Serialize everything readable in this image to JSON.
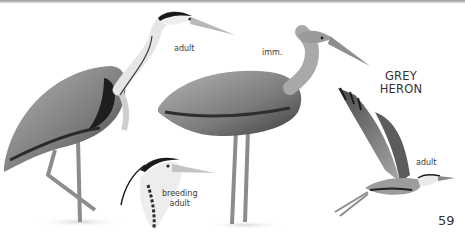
{
  "page": {
    "species_title_line1": "GREY",
    "species_title_line2": "HERON",
    "page_number": "59"
  },
  "illustrations": [
    {
      "id": "standing-adult",
      "label": "adult"
    },
    {
      "id": "immature",
      "label": "imm."
    },
    {
      "id": "breeding-adult-head",
      "label_line1": "breeding",
      "label_line2": "adult"
    },
    {
      "id": "flying-adult",
      "label": "adult"
    }
  ],
  "colors": {
    "background": "#ffffff",
    "text": "#333333",
    "plumage_dark": "#2a2a2a",
    "plumage_mid": "#8a8a8a",
    "plumage_light": "#d9d9d9"
  }
}
